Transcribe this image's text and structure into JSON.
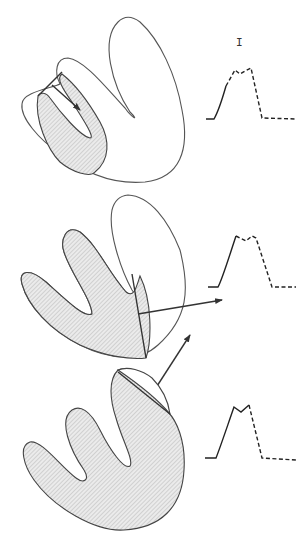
{
  "figure": {
    "panel_label": "I",
    "panels": [
      {
        "id": "top",
        "description": "heart-like contour with inner shaded region; vector points inward",
        "trace": "depolarization waveform: solid rising limb, dashed plateau and fall"
      },
      {
        "id": "middle",
        "description": "contour with larger shaded region; vector points right-outward",
        "trace": "waveform with solid upstroke, dashed notched peak and descent"
      },
      {
        "id": "bottom",
        "description": "almost fully shaded contour; vector points up-right",
        "trace": "waveform with solid upstroke and notched peak, dashed descent"
      }
    ]
  },
  "colors": {
    "line": "#333333",
    "hatch": "#bdbdbd",
    "background": "#ffffff"
  }
}
